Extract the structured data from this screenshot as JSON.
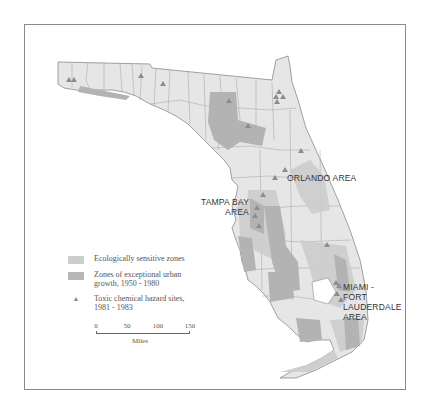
{
  "map": {
    "region": "Florida",
    "colors": {
      "land": "#e6e6e6",
      "county_border": "#9a9a9a",
      "ecologically_sensitive": "#c9c9c9",
      "urban_growth": "#b3b3b3",
      "hazard_site": "#8c8c8c",
      "frame": "#8a8a8a"
    }
  },
  "labels": {
    "orlando": "ORLANDO AREA",
    "tampa_line1": "TAMPA BAY",
    "tampa_line2": "AREA",
    "miami_line1": "MIAMI -",
    "miami_line2": "FORT",
    "miami_line3": "LAUDERDALE",
    "miami_line4": "AREA"
  },
  "legend": {
    "items": [
      {
        "label": "Ecologically sensitive zones",
        "symbol": "swatch-light"
      },
      {
        "label": "Zones of exceptional urban growth, 1950 - 1980",
        "symbol": "swatch-dark"
      },
      {
        "label": "Toxic chemical hazard sites, 1981 - 1983",
        "symbol": "triangle"
      }
    ]
  },
  "scale": {
    "ticks": [
      "0",
      "50",
      "100",
      "150"
    ],
    "unit": "Miles"
  }
}
